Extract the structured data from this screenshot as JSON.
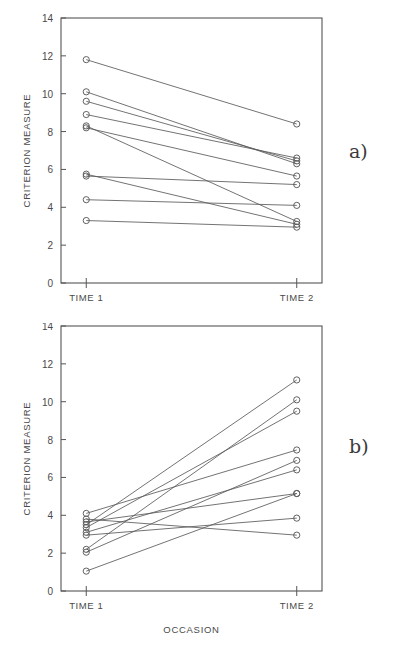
{
  "figure": {
    "panel_a_letter": "a)",
    "panel_b_letter": "b)",
    "bottom_caption": ""
  },
  "chart_data": [
    {
      "type": "line",
      "panel": "a)",
      "title": "",
      "subtitle": "",
      "xlabel": "",
      "ylabel": "CRITERION MEASURE",
      "categories": [
        "TIME 1",
        "TIME 2"
      ],
      "x": [
        0,
        1
      ],
      "xlim": [
        -0.12,
        1.12
      ],
      "ylim": [
        0,
        14
      ],
      "yticks": [
        0,
        2,
        4,
        6,
        8,
        10,
        12,
        14
      ],
      "ytick_labels": [
        "0",
        "2",
        "4",
        "6",
        "8",
        "10",
        "12",
        "14"
      ],
      "xtick_labels": [
        "TIME 1",
        "TIME 2"
      ],
      "grid": false,
      "legend": "none",
      "marker": "open-circle",
      "series": [
        {
          "name": "subject-1",
          "values": [
            11.8,
            8.4
          ]
        },
        {
          "name": "subject-2",
          "values": [
            10.1,
            6.3
          ]
        },
        {
          "name": "subject-3",
          "values": [
            9.6,
            6.45
          ]
        },
        {
          "name": "subject-4",
          "values": [
            8.9,
            6.6
          ]
        },
        {
          "name": "subject-5",
          "values": [
            8.3,
            3.25
          ]
        },
        {
          "name": "subject-6",
          "values": [
            8.2,
            5.65
          ]
        },
        {
          "name": "subject-7",
          "values": [
            5.75,
            3.1
          ]
        },
        {
          "name": "subject-8",
          "values": [
            5.65,
            5.2
          ]
        },
        {
          "name": "subject-9",
          "values": [
            4.4,
            4.1
          ]
        },
        {
          "name": "subject-10",
          "values": [
            3.3,
            2.95
          ]
        }
      ]
    },
    {
      "type": "line",
      "panel": "b)",
      "title": "",
      "subtitle": "",
      "xlabel": "OCCASION",
      "ylabel": "CRITERION MEASURE",
      "categories": [
        "TIME 1",
        "TIME 2"
      ],
      "x": [
        0,
        1
      ],
      "xlim": [
        -0.12,
        1.12
      ],
      "ylim": [
        0,
        14
      ],
      "yticks": [
        0,
        2,
        4,
        6,
        8,
        10,
        12,
        14
      ],
      "ytick_labels": [
        "0",
        "2",
        "4",
        "6",
        "8",
        "10",
        "12",
        "14"
      ],
      "xtick_labels": [
        "TIME 1",
        "TIME 2"
      ],
      "grid": false,
      "legend": "none",
      "marker": "open-circle",
      "series": [
        {
          "name": "subject-1",
          "values": [
            3.5,
            11.15
          ]
        },
        {
          "name": "subject-2",
          "values": [
            2.2,
            10.1
          ]
        },
        {
          "name": "subject-3",
          "values": [
            3.35,
            9.5
          ]
        },
        {
          "name": "subject-4",
          "values": [
            4.1,
            7.45
          ]
        },
        {
          "name": "subject-5",
          "values": [
            2.05,
            6.9
          ]
        },
        {
          "name": "subject-6",
          "values": [
            3.1,
            6.4
          ]
        },
        {
          "name": "subject-7",
          "values": [
            3.65,
            5.15
          ]
        },
        {
          "name": "subject-8",
          "values": [
            1.05,
            5.15
          ]
        },
        {
          "name": "subject-9",
          "values": [
            2.95,
            3.85
          ]
        },
        {
          "name": "subject-10",
          "values": [
            3.8,
            2.95
          ]
        }
      ]
    }
  ],
  "axes": {
    "y_title": "CRITERION MEASURE",
    "x_title": "OCCASION",
    "tick_time1": "TIME 1",
    "tick_time2": "TIME 2"
  },
  "colors": {
    "axis": "#555555",
    "line": "#5a5a5a",
    "marker": "#5a5a5a",
    "text": "#4a4a4a",
    "background": "#ffffff"
  }
}
